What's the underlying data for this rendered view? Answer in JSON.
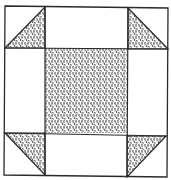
{
  "diagram": {
    "type": "quilt-block",
    "pattern": "shoo-fly / churn-dash style nine-patch",
    "grid": "3x3",
    "colors": {
      "background": "#ffffff",
      "line": "#2a2a2a",
      "fill": "#8c8c8c"
    },
    "cells": [
      {
        "row": 0,
        "col": 0,
        "content": "half-square triangle (shaded lower-right)"
      },
      {
        "row": 0,
        "col": 1,
        "content": "plain"
      },
      {
        "row": 0,
        "col": 2,
        "content": "half-square triangle (shaded lower-left)"
      },
      {
        "row": 1,
        "col": 0,
        "content": "plain"
      },
      {
        "row": 1,
        "col": 1,
        "content": "shaded square"
      },
      {
        "row": 1,
        "col": 2,
        "content": "plain"
      },
      {
        "row": 2,
        "col": 0,
        "content": "half-square triangle (shaded upper-right)"
      },
      {
        "row": 2,
        "col": 1,
        "content": "plain"
      },
      {
        "row": 2,
        "col": 2,
        "content": "half-square triangle (shaded upper-left)"
      }
    ]
  }
}
